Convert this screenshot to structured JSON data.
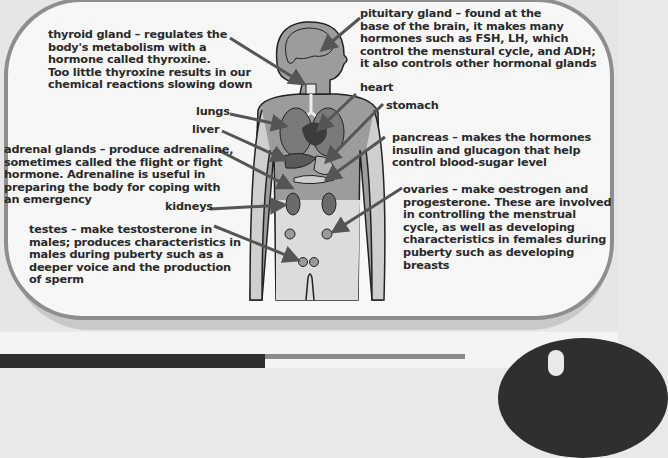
{
  "diagram": {
    "colors": {
      "panel_border": "#8e8e8e",
      "panel_fill": "#f7f7f7",
      "body_fill": "#9a9a9a",
      "organ_fill": "#6e6e6e",
      "arrow": "#555555",
      "text": "#2b2b2b"
    },
    "labels": {
      "thyroid": "thyroid gland – regulates the\nbody's metabolism with a\nhormone called thyroxine.\nToo little thyroxine results in our\nchemical reactions slowing down",
      "pituitary": "pituitary gland – found at the\nbase of the brain, it makes many\nhormones such as FSH, LH, which\ncontrol the menstural cycle, and ADH;\nit also controls other hormonal glands",
      "heart": "heart",
      "lungs": "lungs",
      "stomach": "stomach",
      "liver": "liver",
      "pancreas": "pancreas – makes the hormones\ninsulin and glucagon that help\ncontrol blood-sugar level",
      "adrenal": "adrenal glands – produce adrenaline,\nsometimes called the flight or fight\nhormone. Adrenaline is useful in\npreparing the body for coping with\nan emergency",
      "kidneys": "kidneys",
      "ovaries": "ovaries – make oestrogen and\nprogesterone. These are involved\nin controlling the menstrual\ncycle, as well as developing\ncharacteristics in females during\npuberty such as developing\nbreasts",
      "testes": "testes – make testosterone in\nmales; produces characteristics in\nmales during puberty such as a\ndeeper voice and the production\nof sperm"
    }
  }
}
